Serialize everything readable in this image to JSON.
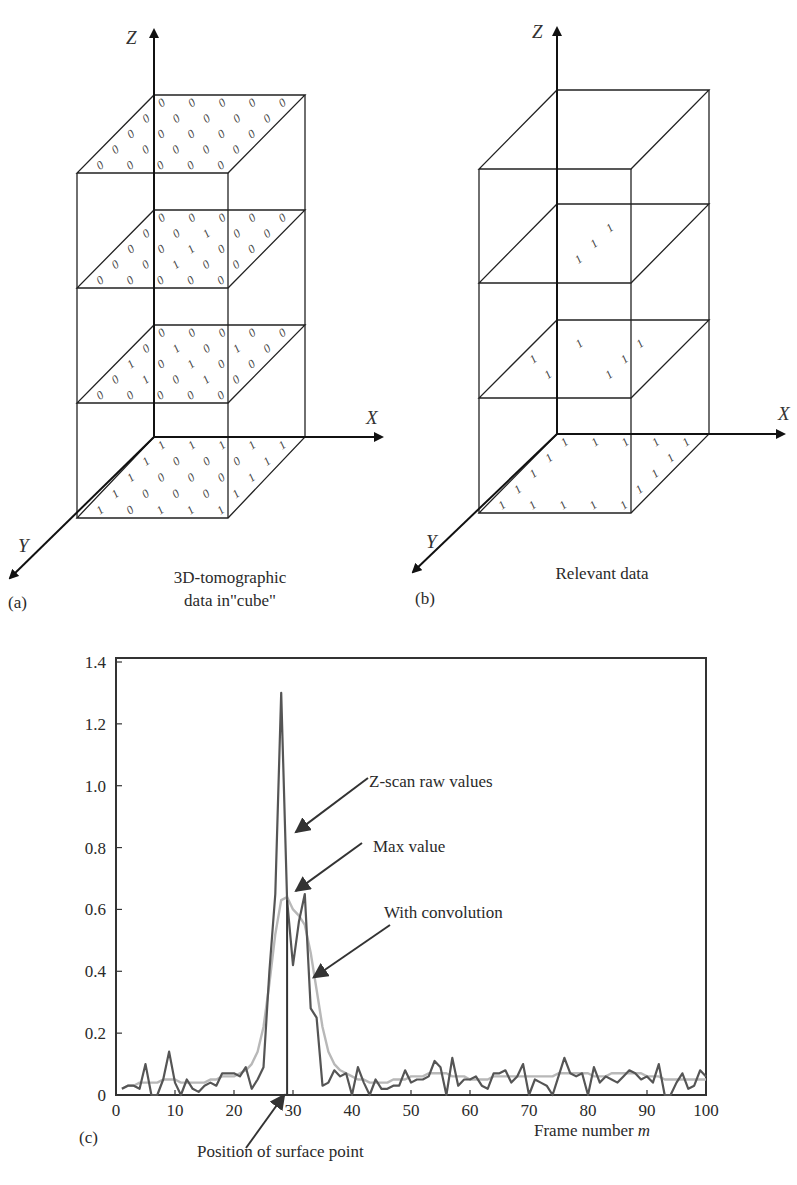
{
  "panels": {
    "a": {
      "letter": "(a)",
      "caption_line1": "3D-tomographic",
      "caption_line2": "data in\"cube\"",
      "axis_labels": {
        "x": "X",
        "y": "Y",
        "z": "Z"
      },
      "layers": [
        {
          "name": "top",
          "grid": [
            [
              "0",
              "0",
              "0",
              "0",
              "0"
            ],
            [
              "0",
              "0",
              "0",
              "0",
              "0"
            ],
            [
              "0",
              "0",
              "0",
              "0",
              "0"
            ],
            [
              "0",
              "0",
              "0",
              "0",
              "0"
            ],
            [
              "0",
              "0",
              "0",
              "0",
              "0"
            ]
          ]
        },
        {
          "name": "upper-middle",
          "grid": [
            [
              "0",
              "0",
              "0",
              "0",
              "0"
            ],
            [
              "0",
              "0",
              "1",
              "0",
              "0"
            ],
            [
              "0",
              "0",
              "1",
              "0",
              "0"
            ],
            [
              "0",
              "0",
              "1",
              "0",
              "0"
            ],
            [
              "0",
              "0",
              "0",
              "0",
              "0"
            ]
          ]
        },
        {
          "name": "lower-middle",
          "grid": [
            [
              "0",
              "0",
              "0",
              "0",
              "0"
            ],
            [
              "0",
              "1",
              "0",
              "1",
              "0"
            ],
            [
              "1",
              "0",
              "1",
              "0",
              "0"
            ],
            [
              "0",
              "1",
              "0",
              "1",
              "0"
            ],
            [
              "0",
              "0",
              "0",
              "0",
              "0"
            ]
          ]
        },
        {
          "name": "bottom",
          "grid": [
            [
              "1",
              "1",
              "1",
              "1",
              "1"
            ],
            [
              "1",
              "0",
              "0",
              "0",
              "1"
            ],
            [
              "1",
              "0",
              "0",
              "0",
              "1"
            ],
            [
              "1",
              "0",
              "0",
              "0",
              "1"
            ],
            [
              "1",
              "0",
              "1",
              "1",
              "1"
            ]
          ]
        }
      ]
    },
    "b": {
      "letter": "(b)",
      "caption": "Relevant data",
      "axis_labels": {
        "x": "X",
        "y": "Y",
        "z": "Z"
      },
      "layers": [
        {
          "name": "top",
          "grid": [
            [
              "",
              "",
              "",
              "",
              ""
            ],
            [
              "",
              "",
              "",
              "",
              ""
            ],
            [
              "",
              "",
              "",
              "",
              ""
            ],
            [
              "",
              "",
              "",
              "",
              ""
            ],
            [
              "",
              "",
              "",
              "",
              ""
            ]
          ]
        },
        {
          "name": "upper-middle",
          "grid": [
            [
              "",
              "",
              "",
              "",
              ""
            ],
            [
              "",
              "",
              "1",
              "",
              ""
            ],
            [
              "",
              "",
              "1",
              "",
              ""
            ],
            [
              "",
              "",
              "1",
              "",
              ""
            ],
            [
              "",
              "",
              "",
              "",
              ""
            ]
          ]
        },
        {
          "name": "lower-middle",
          "grid": [
            [
              "",
              "",
              "",
              "",
              ""
            ],
            [
              "",
              "1",
              "",
              "1",
              ""
            ],
            [
              "1",
              "",
              "",
              "1",
              ""
            ],
            [
              "",
              "1",
              "",
              "1",
              ""
            ],
            [
              "",
              "",
              "",
              "",
              ""
            ]
          ]
        },
        {
          "name": "bottom",
          "grid": [
            [
              "1",
              "1",
              "1",
              "1",
              "1"
            ],
            [
              "1",
              "",
              "",
              "",
              "1"
            ],
            [
              "1",
              "",
              "",
              "",
              "1"
            ],
            [
              "1",
              "",
              "",
              "",
              "1"
            ],
            [
              "1",
              "1",
              "1",
              "1",
              "1"
            ]
          ]
        }
      ]
    },
    "c": {
      "letter": "(c)"
    }
  },
  "chart_data": {
    "type": "line",
    "title": "",
    "xlabel": "Frame number m",
    "ylabel": "",
    "xlim": [
      0,
      100
    ],
    "ylim": [
      0,
      1.4
    ],
    "xticks": [
      "0",
      "10",
      "20",
      "30",
      "40",
      "50",
      "60",
      "70",
      "80",
      "90",
      "100"
    ],
    "yticks": [
      "0",
      "0.2",
      "0.4",
      "0.6",
      "0.8",
      "1.0",
      "1.2",
      "1.4"
    ],
    "grid": false,
    "series": [
      {
        "name": "Z-scan raw values",
        "color": "#555555",
        "x": [
          1,
          2,
          3,
          4,
          5,
          6,
          7,
          8,
          9,
          10,
          11,
          12,
          13,
          14,
          15,
          16,
          17,
          18,
          19,
          20,
          21,
          22,
          23,
          24,
          25,
          26,
          27,
          28,
          29,
          30,
          31,
          32,
          33,
          34,
          35,
          36,
          37,
          38,
          39,
          40,
          41,
          42,
          43,
          44,
          45,
          46,
          47,
          48,
          49,
          50,
          51,
          52,
          53,
          54,
          55,
          56,
          57,
          58,
          59,
          60,
          61,
          62,
          63,
          64,
          65,
          66,
          67,
          68,
          69,
          70,
          71,
          72,
          73,
          74,
          75,
          76,
          77,
          78,
          79,
          80,
          81,
          82,
          83,
          84,
          85,
          86,
          87,
          88,
          89,
          90,
          91,
          92,
          93,
          94,
          95,
          96,
          97,
          98,
          99,
          100
        ],
        "values": [
          0.02,
          0.03,
          0.03,
          0.02,
          0.1,
          0.0,
          0.0,
          0.05,
          0.14,
          0.04,
          0.0,
          0.05,
          0.02,
          0.01,
          0.03,
          0.04,
          0.03,
          0.07,
          0.07,
          0.07,
          0.06,
          0.09,
          0.02,
          0.05,
          0.09,
          0.4,
          0.65,
          1.3,
          0.63,
          0.42,
          0.56,
          0.65,
          0.28,
          0.25,
          0.03,
          0.04,
          0.08,
          0.06,
          0.07,
          0.0,
          0.09,
          0.04,
          0.0,
          0.05,
          0.02,
          0.02,
          0.03,
          0.03,
          0.08,
          0.04,
          0.05,
          0.05,
          0.06,
          0.11,
          0.09,
          0.0,
          0.12,
          0.03,
          0.05,
          0.05,
          0.06,
          0.03,
          0.02,
          0.07,
          0.07,
          0.08,
          0.04,
          0.06,
          0.1,
          0.0,
          0.05,
          0.04,
          0.03,
          0.0,
          0.06,
          0.12,
          0.07,
          0.06,
          0.07,
          0.0,
          0.09,
          0.04,
          0.06,
          0.05,
          0.04,
          0.06,
          0.08,
          0.07,
          0.05,
          0.06,
          0.04,
          0.1,
          0.0,
          0.0,
          0.04,
          0.07,
          0.02,
          0.03,
          0.08,
          0.06
        ]
      },
      {
        "name": "With convolution",
        "color": "#b8b8b8",
        "x": [
          1,
          2,
          3,
          4,
          5,
          6,
          7,
          8,
          9,
          10,
          11,
          12,
          13,
          14,
          15,
          16,
          17,
          18,
          19,
          20,
          21,
          22,
          23,
          24,
          25,
          26,
          27,
          28,
          29,
          30,
          31,
          32,
          33,
          34,
          35,
          36,
          37,
          38,
          39,
          40,
          41,
          42,
          43,
          44,
          45,
          46,
          47,
          48,
          49,
          50,
          51,
          52,
          53,
          54,
          55,
          56,
          57,
          58,
          59,
          60,
          61,
          62,
          63,
          64,
          65,
          66,
          67,
          68,
          69,
          70,
          71,
          72,
          73,
          74,
          75,
          76,
          77,
          78,
          79,
          80,
          81,
          82,
          83,
          84,
          85,
          86,
          87,
          88,
          89,
          90,
          91,
          92,
          93,
          94,
          95,
          96,
          97,
          98,
          99,
          100
        ],
        "values": [
          0.02,
          0.03,
          0.03,
          0.04,
          0.04,
          0.04,
          0.04,
          0.05,
          0.05,
          0.05,
          0.04,
          0.04,
          0.04,
          0.04,
          0.04,
          0.05,
          0.05,
          0.06,
          0.06,
          0.06,
          0.07,
          0.08,
          0.1,
          0.14,
          0.22,
          0.36,
          0.52,
          0.63,
          0.64,
          0.6,
          0.58,
          0.55,
          0.46,
          0.34,
          0.22,
          0.14,
          0.1,
          0.08,
          0.07,
          0.06,
          0.05,
          0.05,
          0.04,
          0.04,
          0.04,
          0.04,
          0.05,
          0.05,
          0.05,
          0.06,
          0.06,
          0.06,
          0.07,
          0.07,
          0.07,
          0.07,
          0.06,
          0.06,
          0.06,
          0.05,
          0.05,
          0.05,
          0.05,
          0.06,
          0.06,
          0.06,
          0.06,
          0.06,
          0.06,
          0.06,
          0.06,
          0.06,
          0.06,
          0.06,
          0.07,
          0.07,
          0.07,
          0.07,
          0.07,
          0.07,
          0.06,
          0.06,
          0.06,
          0.07,
          0.07,
          0.07,
          0.07,
          0.07,
          0.07,
          0.06,
          0.06,
          0.06,
          0.05,
          0.05,
          0.05,
          0.05,
          0.05,
          0.05,
          0.05,
          0.05
        ]
      }
    ],
    "markers": [
      {
        "name": "Position of surface point",
        "x": 29,
        "type": "vertical-line"
      }
    ],
    "annotations": [
      {
        "text": "Z-scan raw values",
        "target": "raw peak",
        "points_to": [
          30.5,
          0.85
        ]
      },
      {
        "text": "Max value",
        "target": "max of convolution",
        "points_to": [
          30.5,
          0.66
        ]
      },
      {
        "text": "With convolution",
        "target": "convolved curve",
        "points_to": [
          33.5,
          0.38
        ]
      },
      {
        "text": "Position of surface point",
        "target": "surface line",
        "points_to": [
          28.5,
          0.0
        ]
      }
    ]
  }
}
